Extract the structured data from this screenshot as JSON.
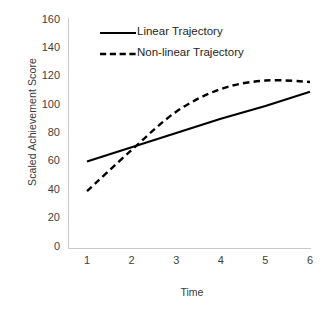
{
  "chart_data": {
    "type": "line",
    "title": "",
    "xlabel": "Time",
    "ylabel": "Scaled Achievement Score",
    "x": [
      1,
      2,
      3,
      4,
      5,
      6
    ],
    "xticklabels": [
      "1",
      "2",
      "3",
      "4",
      "5",
      "6"
    ],
    "yticklabels": [
      "0",
      "20",
      "40",
      "60",
      "80",
      "100",
      "120",
      "140",
      "160"
    ],
    "yticks": [
      0,
      20,
      40,
      60,
      80,
      100,
      120,
      140,
      160
    ],
    "xlim": [
      1,
      6
    ],
    "ylim": [
      0,
      160
    ],
    "grid": false,
    "legend_position": "top-center",
    "series": [
      {
        "name": "Linear Trajectory",
        "values": [
          60,
          70,
          80,
          90,
          99,
          109
        ],
        "style": "solid",
        "color": "#000000"
      },
      {
        "name": "Non-linear Trajectory",
        "values": [
          39,
          68,
          95,
          111,
          117,
          116
        ],
        "style": "dashed",
        "color": "#000000"
      }
    ]
  },
  "legend": {
    "items": [
      {
        "label": "Linear Trajectory",
        "style": "solid"
      },
      {
        "label": "Non-linear Trajectory",
        "style": "dashed"
      }
    ]
  },
  "colors": {
    "axis": "#c9c9c9",
    "tick_text": "#3f3f3f",
    "title_text": "#3a3a3a",
    "series": "#000000",
    "background": "#ffffff"
  }
}
